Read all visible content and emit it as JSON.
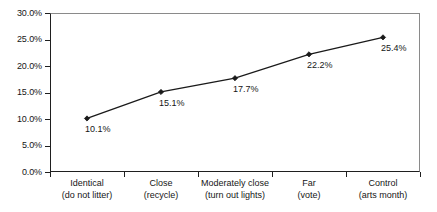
{
  "chart_data": {
    "type": "line",
    "title": "",
    "xlabel": "",
    "ylabel": "",
    "ylim": [
      0,
      30
    ],
    "grid": false,
    "legend": "none",
    "categories": [
      "Identical (do not litter)",
      "Close (recycle)",
      "Moderately close (turn out lights)",
      "Far (vote)",
      "Control (arts month)"
    ],
    "category_lines": [
      {
        "line1": "Identical",
        "line2": "(do not litter)"
      },
      {
        "line1": "Close",
        "line2": "(recycle)"
      },
      {
        "line1": "Moderately close",
        "line2": "(turn out lights)"
      },
      {
        "line1": "Far",
        "line2": "(vote)"
      },
      {
        "line1": "Control",
        "line2": "(arts month)"
      }
    ],
    "values": [
      10.1,
      15.1,
      17.7,
      22.2,
      25.4
    ],
    "point_labels": [
      "10.1%",
      "15.1%",
      "17.7%",
      "22.2%",
      "25.4%"
    ],
    "y_ticks": [
      0,
      5,
      10,
      15,
      20,
      25,
      30
    ],
    "y_tick_labels": [
      "0.0%",
      "5.0%",
      "10.0%",
      "15.0%",
      "20.0%",
      "25.0%",
      "30.0%"
    ],
    "series": [
      {
        "name": "percent",
        "values": [
          10.1,
          15.1,
          17.7,
          22.2,
          25.4
        ]
      }
    ],
    "colors": {
      "line": "#1a1a1a",
      "marker": "#1a1a1a",
      "axis": "#1f1f1f",
      "frame": "#8a8a8a",
      "text": "#161616",
      "background": "#ffffff"
    },
    "marker_style": "filled-diamond"
  }
}
